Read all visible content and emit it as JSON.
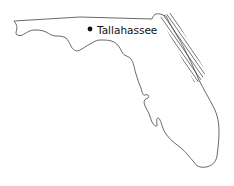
{
  "map": {
    "region": "Florida",
    "outline_color": "#444444",
    "hatch_color": "#333333",
    "background": "#ffffff",
    "cities": [
      {
        "name": "Tallahassee",
        "marker": "filled-circle",
        "x": 90,
        "y": 29
      }
    ],
    "highlighted_area": {
      "description": "hatched coastal band along northeast Atlantic coast",
      "pattern": "diagonal-hatch"
    }
  }
}
